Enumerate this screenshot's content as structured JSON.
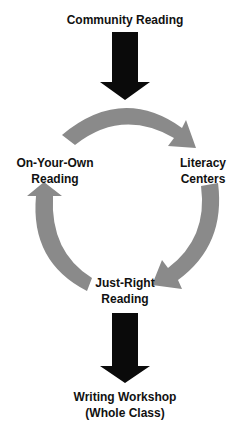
{
  "colors": {
    "black_arrow": "#0a0a0a",
    "gray_arrow": "#8a8a8a",
    "text": "#111111",
    "background": "#ffffff"
  },
  "nodes": {
    "community_reading": {
      "line1": "Community Reading"
    },
    "on_your_own": {
      "line1": "On-Your-Own",
      "line2": "Reading"
    },
    "literacy_centers": {
      "line1": "Literacy",
      "line2": "Centers"
    },
    "just_right": {
      "line1": "Just-Right",
      "line2": "Reading"
    },
    "writing_workshop": {
      "line1": "Writing Workshop",
      "line2": "(Whole Class)"
    }
  },
  "arrows": [
    {
      "from": "Community Reading",
      "to": "cycle",
      "style": "black-down"
    },
    {
      "from": "On-Your-Own Reading",
      "to": "Literacy Centers",
      "style": "gray-curved"
    },
    {
      "from": "Literacy Centers",
      "to": "Just-Right Reading",
      "style": "gray-curved"
    },
    {
      "from": "Just-Right Reading",
      "to": "On-Your-Own Reading",
      "style": "gray-curved"
    },
    {
      "from": "Just-Right Reading",
      "to": "Writing Workshop (Whole Class)",
      "style": "black-down"
    }
  ]
}
